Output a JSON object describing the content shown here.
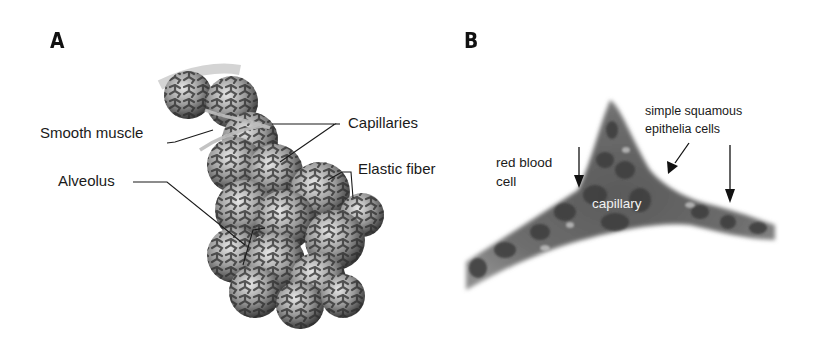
{
  "figure": {
    "panels": [
      {
        "id": "A",
        "letter": "A",
        "subject": "alveolar sac illustration",
        "labels": {
          "smooth_muscle": "Smooth muscle",
          "capillaries": "Capillaries",
          "elastic_fiber": "Elastic fiber",
          "alveolus": "Alveolus"
        }
      },
      {
        "id": "B",
        "letter": "B",
        "subject": "capillary micrograph",
        "labels": {
          "red_blood_cell_line1": "red blood",
          "red_blood_cell_line2": "cell",
          "squamous_line1": "simple squamous",
          "squamous_line2": "epithelia cells",
          "capillary": "capillary"
        }
      }
    ]
  }
}
